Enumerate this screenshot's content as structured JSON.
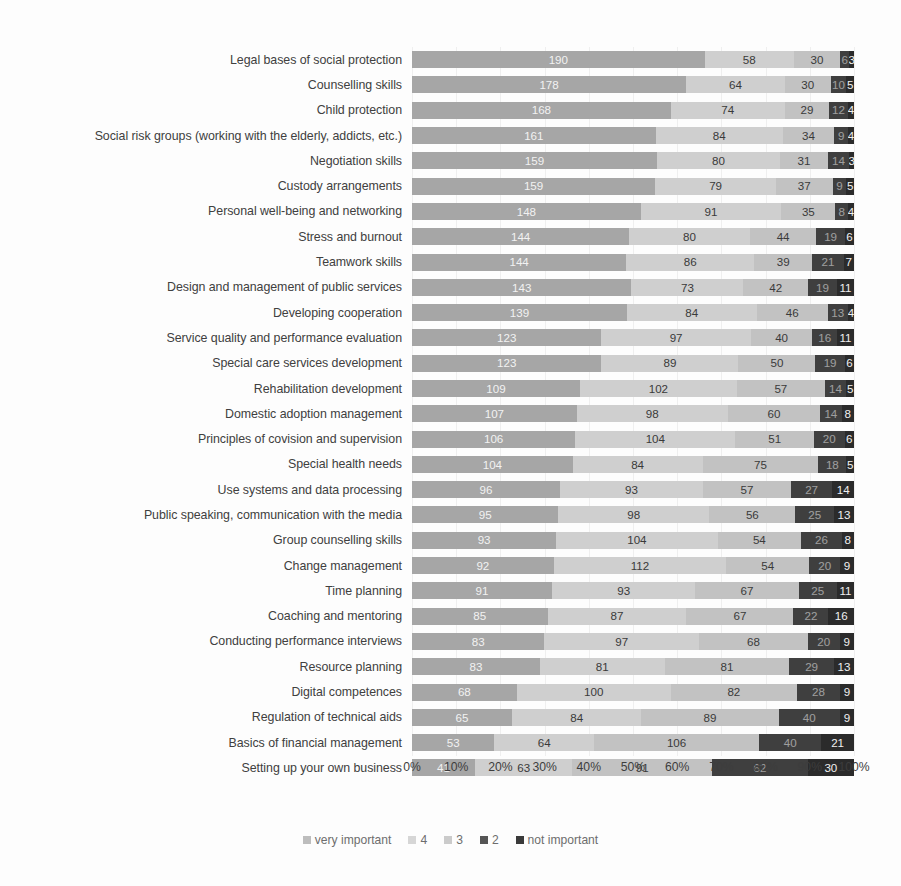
{
  "chart_data": {
    "type": "bar",
    "orientation": "horizontal",
    "stacked": true,
    "normalized": "100%",
    "title": "",
    "xlabel": "",
    "ylabel": "",
    "grid": true,
    "legend_position": "bottom",
    "xlim": [
      0,
      100
    ],
    "xticks": [
      "0%",
      "10%",
      "20%",
      "30%",
      "40%",
      "50%",
      "60%",
      "70%",
      "80%",
      "90%",
      "100%"
    ],
    "categories": [
      "Legal bases of social protection",
      "Counselling skills",
      "Child protection",
      "Social risk groups (working with the elderly, addicts, etc.)",
      "Negotiation skills",
      "Custody arrangements",
      "Personal well-being and networking",
      "Stress and burnout",
      "Teamwork skills",
      "Design and management of public services",
      "Developing cooperation",
      "Service quality and performance evaluation",
      "Special care services development",
      "Rehabilitation development",
      "Domestic adoption management",
      "Principles of covision and supervision",
      "Special health needs",
      "Use systems and data processing",
      "Public speaking, communication with the media",
      "Group counselling skills",
      "Change management",
      "Time planning",
      "Coaching and mentoring",
      "Conducting performance interviews",
      "Resource planning",
      "Digital competences",
      "Regulation of technical aids",
      "Basics of  financial management",
      "Setting up your own business"
    ],
    "series": [
      {
        "name": "very important",
        "color": "#a6a6a6",
        "values": [
          190,
          178,
          168,
          161,
          159,
          159,
          148,
          144,
          144,
          143,
          139,
          123,
          123,
          109,
          107,
          106,
          104,
          96,
          95,
          93,
          92,
          91,
          85,
          83,
          83,
          68,
          65,
          53,
          41
        ]
      },
      {
        "name": "4",
        "color": "#cfcfcf",
        "values": [
          58,
          64,
          74,
          84,
          80,
          79,
          91,
          80,
          86,
          73,
          84,
          97,
          89,
          102,
          98,
          104,
          84,
          93,
          98,
          104,
          112,
          93,
          87,
          97,
          81,
          100,
          84,
          64,
          63
        ]
      },
      {
        "name": "3",
        "color": "#c2c2c2",
        "values": [
          30,
          30,
          29,
          34,
          31,
          37,
          35,
          44,
          39,
          42,
          46,
          40,
          50,
          57,
          60,
          51,
          75,
          57,
          56,
          54,
          54,
          67,
          67,
          68,
          81,
          82,
          89,
          106,
          91
        ]
      },
      {
        "name": "2",
        "color": "#3f3f3f",
        "values": [
          6,
          10,
          12,
          9,
          14,
          9,
          8,
          19,
          21,
          19,
          13,
          16,
          19,
          14,
          14,
          20,
          18,
          27,
          25,
          26,
          20,
          25,
          22,
          20,
          29,
          28,
          40,
          40,
          62
        ]
      },
      {
        "name": "not important",
        "color": "#2b2b2b",
        "values": [
          3,
          5,
          4,
          4,
          3,
          5,
          4,
          6,
          7,
          11,
          4,
          11,
          6,
          5,
          8,
          6,
          5,
          14,
          13,
          8,
          9,
          11,
          16,
          9,
          13,
          9,
          9,
          21,
          30
        ]
      }
    ]
  },
  "legend": {
    "items": [
      {
        "label": "very important"
      },
      {
        "label": "4"
      },
      {
        "label": "3"
      },
      {
        "label": "2"
      },
      {
        "label": "not important"
      }
    ]
  }
}
